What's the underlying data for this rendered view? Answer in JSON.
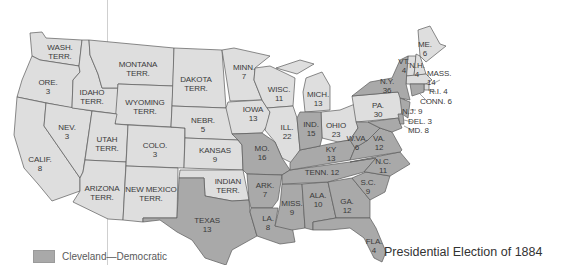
{
  "title": "Presidential Election of 1884",
  "legend": {
    "items": [
      {
        "label": "Cleveland—Democratic",
        "color": "#a9a9a9"
      }
    ]
  },
  "colors": {
    "democratic": "#a9a9a9",
    "other": "#dedede",
    "border": "#5a5a5a",
    "background": "#ffffff"
  },
  "states": [
    {
      "name": "WASH.\nTERR.",
      "votes": null,
      "party": "territory"
    },
    {
      "name": "ORE.",
      "votes": 3,
      "party": "other"
    },
    {
      "name": "CALIF.",
      "votes": 8,
      "party": "other"
    },
    {
      "name": "NEV.",
      "votes": 3,
      "party": "other"
    },
    {
      "name": "IDAHO\nTERR.",
      "votes": null,
      "party": "territory"
    },
    {
      "name": "MONTANA\nTERR.",
      "votes": null,
      "party": "territory"
    },
    {
      "name": "WYOMING\nTERR.",
      "votes": null,
      "party": "territory"
    },
    {
      "name": "UTAH\nTERR.",
      "votes": null,
      "party": "territory"
    },
    {
      "name": "ARIZONA\nTERR.",
      "votes": null,
      "party": "territory"
    },
    {
      "name": "NEW MEXICO\nTERR.",
      "votes": null,
      "party": "territory"
    },
    {
      "name": "COLO.",
      "votes": 3,
      "party": "other"
    },
    {
      "name": "DAKOTA\nTERR.",
      "votes": null,
      "party": "territory"
    },
    {
      "name": "NEBR.",
      "votes": 5,
      "party": "other"
    },
    {
      "name": "KANSAS",
      "votes": 9,
      "party": "other"
    },
    {
      "name": "INDIAN\nTERR.",
      "votes": null,
      "party": "territory"
    },
    {
      "name": "TEXAS",
      "votes": 13,
      "party": "democratic"
    },
    {
      "name": "MINN.",
      "votes": 7,
      "party": "other"
    },
    {
      "name": "IOWA",
      "votes": 13,
      "party": "other"
    },
    {
      "name": "MO.",
      "votes": 16,
      "party": "democratic"
    },
    {
      "name": "ARK.",
      "votes": 7,
      "party": "democratic"
    },
    {
      "name": "LA.",
      "votes": 8,
      "party": "democratic"
    },
    {
      "name": "WISC.",
      "votes": 11,
      "party": "other"
    },
    {
      "name": "ILL.",
      "votes": 22,
      "party": "other"
    },
    {
      "name": "MICH.",
      "votes": 13,
      "party": "other"
    },
    {
      "name": "IND.",
      "votes": 15,
      "party": "democratic"
    },
    {
      "name": "OHIO",
      "votes": 23,
      "party": "other"
    },
    {
      "name": "KY",
      "votes": 13,
      "party": "democratic"
    },
    {
      "name": "TENN.",
      "votes": 12,
      "party": "democratic"
    },
    {
      "name": "MISS.",
      "votes": 9,
      "party": "democratic"
    },
    {
      "name": "ALA.",
      "votes": 10,
      "party": "democratic"
    },
    {
      "name": "GA.",
      "votes": 12,
      "party": "democratic"
    },
    {
      "name": "FLA.",
      "votes": 4,
      "party": "democratic"
    },
    {
      "name": "S.C.",
      "votes": 9,
      "party": "democratic"
    },
    {
      "name": "N.C.",
      "votes": 11,
      "party": "democratic"
    },
    {
      "name": "VA.",
      "votes": 12,
      "party": "democratic"
    },
    {
      "name": "W.VA.",
      "votes": 6,
      "party": "democratic"
    },
    {
      "name": "PA.",
      "votes": 30,
      "party": "other"
    },
    {
      "name": "N.Y.",
      "votes": 36,
      "party": "democratic"
    },
    {
      "name": "VT.",
      "votes": 4,
      "party": "other"
    },
    {
      "name": "N.H.",
      "votes": 4,
      "party": "other"
    },
    {
      "name": "ME.",
      "votes": 6,
      "party": "other"
    },
    {
      "name": "MASS.",
      "votes": 14,
      "party": "other"
    },
    {
      "name": "R.I.",
      "votes": 4,
      "party": "other"
    },
    {
      "name": "CONN.",
      "votes": 6,
      "party": "democratic"
    },
    {
      "name": "N.J.",
      "votes": 9,
      "party": "democratic"
    },
    {
      "name": "DEL.",
      "votes": 3,
      "party": "democratic"
    },
    {
      "name": "MD.",
      "votes": 8,
      "party": "democratic"
    }
  ],
  "labels": {
    "wash": "WASH.\nTERR.",
    "ore": "ORE.\n3",
    "calif": "CALIF.\n8",
    "nev": "NEV.\n3",
    "idaho": "IDAHO\nTERR.",
    "montana": "MONTANA\nTERR.",
    "wyoming": "WYOMING\nTERR.",
    "utah": "UTAH\nTERR.",
    "arizona": "ARIZONA\nTERR.",
    "newmexico": "NEW MEXICO\nTERR.",
    "colo": "COLO.\n3",
    "dakota": "DAKOTA\nTERR.",
    "nebr": "NEBR.\n5",
    "kansas": "KANSAS\n9",
    "indian": "INDIAN\nTERR.",
    "texas": "TEXAS\n13",
    "minn": "MINN.\n7",
    "iowa": "IOWA\n13",
    "mo": "MO.\n16",
    "ark": "ARK.\n7",
    "la": "LA.\n8",
    "wisc": "WISC.\n11",
    "ill": "ILL.\n22",
    "mich": "MICH.\n13",
    "ind": "IND.\n15",
    "ohio": "OHIO\n23",
    "ky": "KY\n13",
    "tenn": "TENN. 12",
    "miss": "MISS.\n9",
    "ala": "ALA.\n10",
    "ga": "GA.\n12",
    "fla": "FLA.\n4",
    "sc": "S.C.\n9",
    "nc": "N.C.\n11",
    "va": "VA.\n12",
    "wva": "W.VA.\n6",
    "pa": "PA.\n30",
    "ny": "N.Y.\n36",
    "vt": "VT.\n4",
    "nh": "N.H.\n4",
    "me": "ME.\n6",
    "mass": "MASS.\n14",
    "ri": "R.I. 4",
    "conn": "CONN. 6",
    "nj": "N.J. 9",
    "del": "DEL. 3",
    "md": "MD. 8"
  }
}
